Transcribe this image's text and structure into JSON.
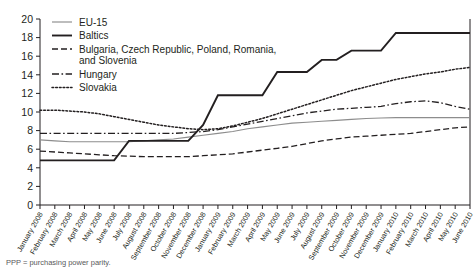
{
  "caption": "PPP = purchasing power parity.",
  "chart_data": {
    "type": "line",
    "title": "",
    "xlabel": "",
    "ylabel": "",
    "ylim": [
      0,
      20
    ],
    "ytick_step": 2,
    "yticks": [
      0,
      2,
      4,
      6,
      8,
      10,
      12,
      14,
      16,
      18,
      20
    ],
    "grid": false,
    "legend_position": "top-left",
    "categories": [
      "January 2008",
      "February 2008",
      "March 2008",
      "April 2008",
      "May 2008",
      "June 2008",
      "July 2008",
      "August 2008",
      "September 2008",
      "October 2008",
      "November 2008",
      "December 2008",
      "January 2009",
      "February 2009",
      "March 2009",
      "April 2009",
      "May 2009",
      "June 2009",
      "July 2009",
      "August 2009",
      "September 2009",
      "October 2009",
      "November 2009",
      "December 2009",
      "January 2010",
      "February 2010",
      "March 2010",
      "April 2010",
      "May 2010",
      "June 2010"
    ],
    "series": [
      {
        "name": "EU-15",
        "style": "solid-thin-gray",
        "color": "#8d8d8d",
        "values": [
          7.0,
          6.9,
          6.8,
          6.8,
          6.8,
          6.8,
          6.8,
          6.9,
          7.0,
          7.1,
          7.3,
          7.5,
          7.7,
          7.9,
          8.2,
          8.4,
          8.6,
          8.8,
          8.9,
          9.0,
          9.1,
          9.2,
          9.3,
          9.35,
          9.4,
          9.4,
          9.4,
          9.4,
          9.4,
          9.4
        ]
      },
      {
        "name": "Baltics",
        "style": "solid-thick-black",
        "color": "#231f20",
        "values": [
          4.8,
          4.8,
          4.8,
          4.8,
          4.8,
          4.8,
          6.9,
          6.9,
          6.9,
          6.9,
          6.9,
          8.6,
          11.8,
          11.8,
          11.8,
          11.8,
          14.3,
          14.3,
          14.3,
          15.6,
          15.6,
          16.6,
          16.6,
          16.6,
          18.5,
          18.5,
          18.5,
          18.5,
          18.5,
          18.5
        ]
      },
      {
        "name": "Bulgaria, Czech Republic, Poland, Romania, and Slovenia",
        "style": "dashed",
        "color": "#231f20",
        "values": [
          5.8,
          5.7,
          5.6,
          5.5,
          5.4,
          5.3,
          5.25,
          5.2,
          5.2,
          5.2,
          5.2,
          5.3,
          5.4,
          5.5,
          5.7,
          5.9,
          6.1,
          6.3,
          6.6,
          6.9,
          7.1,
          7.3,
          7.4,
          7.5,
          7.6,
          7.7,
          7.9,
          8.1,
          8.3,
          8.4
        ]
      },
      {
        "name": "Hungary",
        "style": "dash-dot",
        "color": "#231f20",
        "values": [
          7.7,
          7.7,
          7.7,
          7.7,
          7.7,
          7.7,
          7.7,
          7.7,
          7.7,
          7.7,
          7.8,
          7.9,
          8.1,
          8.4,
          8.7,
          9.0,
          9.3,
          9.6,
          9.9,
          10.1,
          10.3,
          10.4,
          10.5,
          10.6,
          10.9,
          11.1,
          11.2,
          11.0,
          10.6,
          10.3
        ]
      },
      {
        "name": "Slovakia",
        "style": "dotted",
        "color": "#231f20",
        "values": [
          10.2,
          10.2,
          10.1,
          10.0,
          9.8,
          9.5,
          9.2,
          8.9,
          8.6,
          8.4,
          8.2,
          8.1,
          8.2,
          8.5,
          8.9,
          9.3,
          9.8,
          10.3,
          10.8,
          11.3,
          11.8,
          12.3,
          12.7,
          13.1,
          13.5,
          13.8,
          14.1,
          14.3,
          14.6,
          14.8
        ]
      }
    ]
  }
}
